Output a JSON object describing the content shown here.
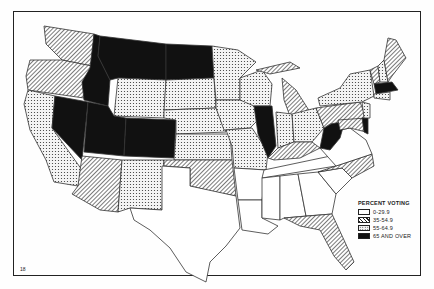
{
  "map": {
    "title": "Percent voting by state",
    "page_number": "18",
    "legend": {
      "title": "PERCENT VOTING",
      "items": [
        {
          "label": "0-29.9",
          "pattern": "white"
        },
        {
          "label": "35-54.9",
          "pattern": "hatched"
        },
        {
          "label": "55-64.9",
          "pattern": "dotted"
        },
        {
          "label": "65 AND OVER",
          "pattern": "black"
        }
      ]
    },
    "states": {
      "WA": "hatched",
      "OR": "hatched",
      "CA": "dotted",
      "NV": "black",
      "ID": "black",
      "MT": "black",
      "WY": "dotted",
      "UT": "black",
      "CO": "black",
      "AZ": "hatched",
      "NM": "dotted",
      "ND": "black",
      "SD": "dotted",
      "NE": "dotted",
      "KS": "dotted",
      "OK": "hatched",
      "TX": "white",
      "MN": "dotted",
      "IA": "dotted",
      "MO": "dotted",
      "AR": "white",
      "LA": "white",
      "WI": "dotted",
      "IL": "black",
      "MI": "hatched",
      "IN": "dotted",
      "OH": "dotted",
      "KY": "hatched",
      "TN": "white",
      "MS": "white",
      "AL": "white",
      "GA": "white",
      "FL": "hatched",
      "SC": "white",
      "NC": "hatched",
      "VA": "white",
      "WV": "black",
      "PA": "hatched",
      "NY": "dotted",
      "VT": "hatched",
      "NH": "dotted",
      "ME": "hatched",
      "MA": "black",
      "CT": "dotted",
      "RI": "dotted",
      "NJ": "dotted",
      "DE": "black",
      "MD": "hatched"
    }
  }
}
